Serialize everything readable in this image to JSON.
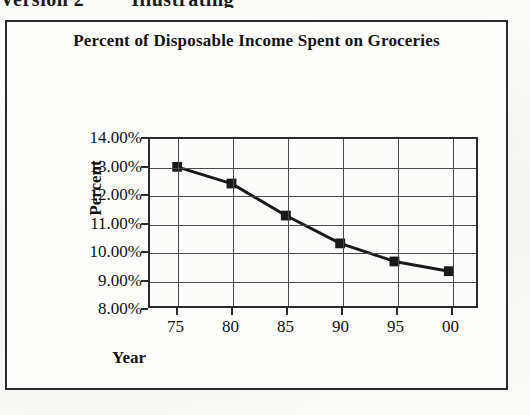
{
  "page": {
    "top_fragment_left": "Version 2",
    "top_fragment_right": "Illustrating"
  },
  "chart_data": {
    "type": "line",
    "title": "Percent of Disposable Income Spent on Groceries",
    "xlabel": "Year",
    "ylabel": "Percent",
    "categories": [
      "75",
      "80",
      "85",
      "90",
      "95",
      "00"
    ],
    "values": [
      13.0,
      12.4,
      11.25,
      10.25,
      9.6,
      9.25
    ],
    "ylim": [
      8.0,
      14.0
    ],
    "ytick_labels": [
      "14.00%",
      "13.00%",
      "12.00%",
      "11.00%",
      "10.00%",
      "9.00%",
      "8.00%"
    ],
    "ytick_values": [
      14.0,
      13.0,
      12.0,
      11.0,
      10.0,
      9.0,
      8.0
    ],
    "grid": "both",
    "legend": "none",
    "marker": "square",
    "series_color": "#1a1a1a",
    "grid_color": "#4a4a4a",
    "axis_color": "#2b2b2b",
    "plot_background": "#fcfcfb"
  }
}
